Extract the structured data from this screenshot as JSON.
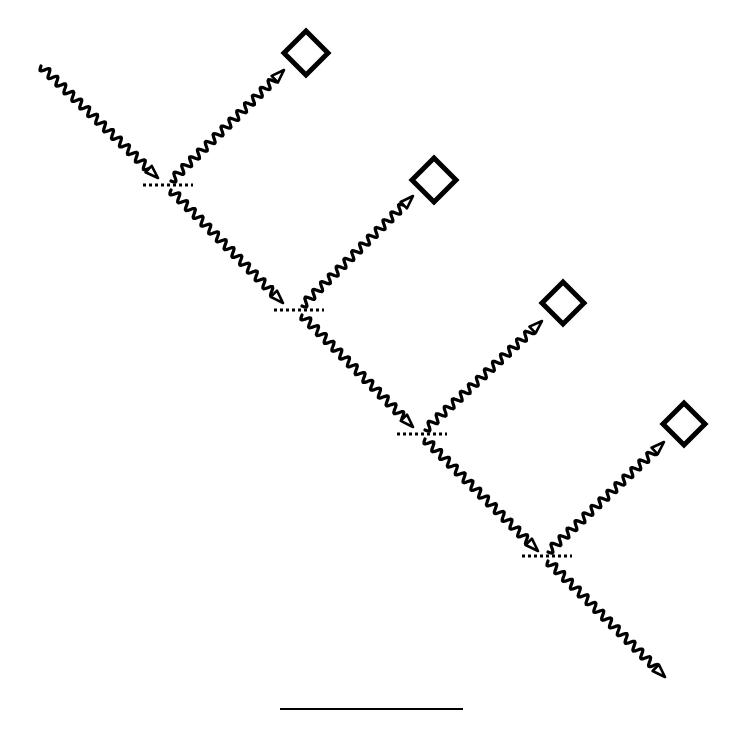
{
  "diagram": {
    "type": "cascaded-beam-splitters",
    "colors": {
      "ink": "#000000",
      "background": "#ffffff"
    },
    "wave": {
      "wavelength": 11,
      "amplitude": 4
    },
    "input_beam": {
      "from": [
        41,
        66
      ],
      "to": [
        158,
        178
      ]
    },
    "stages": [
      {
        "splitter": {
          "x1": 143,
          "x2": 193,
          "y": 185
        },
        "reflected": {
          "from": [
            171,
            181
          ],
          "to": [
            284,
            70
          ]
        },
        "transmitted": {
          "from": [
            171,
            190
          ],
          "to": [
            283,
            303
          ]
        },
        "detector": {
          "cx": 306,
          "cy": 53,
          "half": 22
        }
      },
      {
        "splitter": {
          "x1": 274,
          "x2": 324,
          "y": 310
        },
        "reflected": {
          "from": [
            302,
            306
          ],
          "to": [
            413,
            196
          ]
        },
        "transmitted": {
          "from": [
            302,
            315
          ],
          "to": [
            413,
            427
          ]
        },
        "detector": {
          "cx": 434,
          "cy": 180,
          "half": 22
        }
      },
      {
        "splitter": {
          "x1": 397,
          "x2": 447,
          "y": 434
        },
        "reflected": {
          "from": [
            425,
            430
          ],
          "to": [
            542,
            321
          ]
        },
        "transmitted": {
          "from": [
            425,
            439
          ],
          "to": [
            538,
            551
          ]
        },
        "detector": {
          "cx": 563,
          "cy": 303,
          "half": 21
        }
      },
      {
        "splitter": {
          "x1": 522,
          "x2": 572,
          "y": 556
        },
        "reflected": {
          "from": [
            548,
            552
          ],
          "to": [
            664,
            442
          ]
        },
        "transmitted": {
          "from": [
            548,
            561
          ],
          "to": [
            665,
            677
          ]
        },
        "detector": {
          "cx": 684,
          "cy": 424,
          "half": 21
        }
      }
    ],
    "scale_bar": {
      "x1": 280,
      "x2": 463,
      "y": 709
    }
  }
}
